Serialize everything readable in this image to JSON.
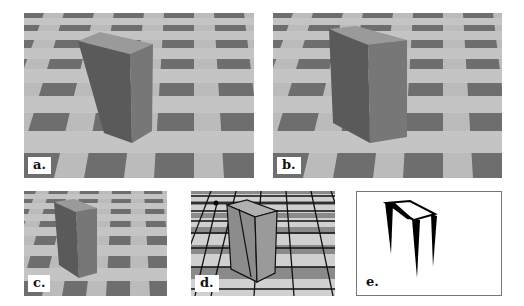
{
  "figure": {
    "panels": [
      {
        "id": "a",
        "label": "a.",
        "description": "Rendered box on checkerboard floor (full size)"
      },
      {
        "id": "b",
        "label": "b.",
        "description": "Rendered box on checkerboard floor, slightly different view"
      },
      {
        "id": "c",
        "label": "c.",
        "description": "Smaller rendering of box on checkerboard floor"
      },
      {
        "id": "d",
        "label": "d.",
        "description": "Box on floor with overlaid grid lines and vertex marker"
      },
      {
        "id": "e",
        "label": "e.",
        "description": "Black silhouette outline of box edges (tapered vertical strokes)"
      }
    ]
  },
  "colors": {
    "tile_light": "#c4c4c4",
    "tile_dark": "#6e6e6e",
    "box_front": "#5a5a5a",
    "box_side": "#777777",
    "box_top": "#9a9a9a",
    "grid_line": "#111111",
    "background": "#ffffff"
  }
}
